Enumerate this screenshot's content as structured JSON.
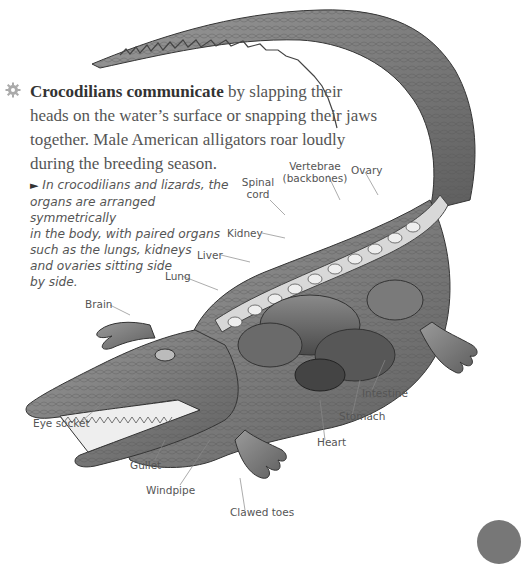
{
  "intro": {
    "icon": "gear-icon",
    "bold_lead": "Crocodilians communicate",
    "lines": [
      " by slapping their",
      "heads on the water’s surface or snapping their jaws",
      "together. Male American alligators roar loudly",
      "during the breeding season."
    ]
  },
  "caption": {
    "marker": "►",
    "lines": [
      "In crocodilians and lizards, the",
      "organs are arranged symmetrically",
      "in the body, with paired organs",
      "such as the lungs, kidneys",
      "and ovaries sitting side",
      "by side."
    ]
  },
  "labels": {
    "spinal_cord_1": "Spinal",
    "spinal_cord_2": "cord",
    "vertebrae_1": "Vertebrae",
    "vertebrae_2": "(backbones)",
    "ovary": "Ovary",
    "kidney": "Kidney",
    "liver": "Liver",
    "lung": "Lung",
    "brain": "Brain",
    "eye_socket": "Eye socket",
    "gullet": "Gullet",
    "windpipe": "Windpipe",
    "clawed_toes": "Clawed toes",
    "heart": "Heart",
    "stomach": "Stomach",
    "intestine": "Intestine"
  }
}
